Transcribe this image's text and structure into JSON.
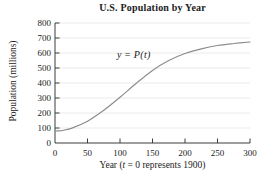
{
  "figure": {
    "title": "U.S. Population by Year",
    "y_axis_label": "Population (millions)",
    "x_axis_label": {
      "pre": "Year (",
      "var": "t",
      "post": " = 0 represents 1900)"
    },
    "curve_label": {
      "lhs": "y",
      "eq": " = ",
      "rhs": "P(t)"
    }
  },
  "colors": {
    "curve": "#8d8d8d",
    "grid": "#e6e5e2",
    "axis": "#3d3d3d",
    "text": "#1c1c1c",
    "background": "#ffffff"
  },
  "chart_data": {
    "type": "line",
    "title": "U.S. Population by Year",
    "xlabel": "Year (t = 0 represents 1900)",
    "ylabel": "Population (millions)",
    "xlim": [
      0,
      300
    ],
    "ylim": [
      0,
      800
    ],
    "x_ticks": [
      0,
      50,
      100,
      150,
      200,
      250,
      300
    ],
    "y_ticks": [
      0,
      100,
      200,
      300,
      400,
      500,
      600,
      700,
      800
    ],
    "grid": "horizontal-light",
    "legend": "none",
    "annotation": {
      "text": "y = P(t)",
      "at_x": 130,
      "at_y": 580
    },
    "series": [
      {
        "name": "P(t)",
        "x": [
          0,
          10,
          25,
          50,
          75,
          100,
          125,
          150,
          175,
          200,
          225,
          250,
          275,
          300
        ],
        "y": [
          80,
          83,
          97,
          145,
          218,
          305,
          398,
          484,
          550,
          597,
          628,
          650,
          663,
          673
        ]
      }
    ]
  }
}
